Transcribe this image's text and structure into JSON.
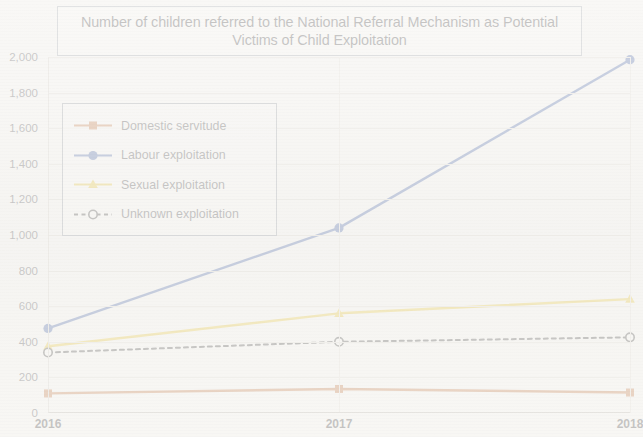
{
  "title": "Number of children referred to the National Referral Mechanism as Potential Victims of Child Exploitation",
  "legend": {
    "items": [
      {
        "label": "Domestic servitude",
        "color": "#c0703a",
        "marker": "square",
        "style": "solid"
      },
      {
        "label": "Labour exploitation",
        "color": "#3b5ba5",
        "marker": "circle",
        "style": "solid"
      },
      {
        "label": "Sexual exploitation",
        "color": "#e8c52e",
        "marker": "triangle",
        "style": "solid"
      },
      {
        "label": "Unknown exploitation",
        "color": "#3b3b3b",
        "marker": "open-circle",
        "style": "dashed"
      }
    ]
  },
  "chart_data": {
    "type": "line",
    "title": "Number of children referred to the National Referral Mechanism as Potential Victims of Child Exploitation",
    "xlabel": "",
    "ylabel": "",
    "categories": [
      "2016",
      "2017",
      "2018"
    ],
    "x_tick_labels": [
      "2016",
      "2017",
      "2018"
    ],
    "y_tick_labels": [
      "0",
      "200",
      "400",
      "600",
      "800",
      "1,000",
      "1,200",
      "1,400",
      "1,600",
      "1,800",
      "2,000"
    ],
    "y_ticks": [
      0,
      200,
      400,
      600,
      800,
      1000,
      1200,
      1400,
      1600,
      1800,
      2000
    ],
    "ylim": [
      0,
      2000
    ],
    "grid": true,
    "grid_axis": "y",
    "legend_position": "upper-left-inside",
    "series": [
      {
        "name": "Domestic servitude",
        "color": "#c0703a",
        "marker": "square",
        "line_style": "solid",
        "values": [
          110,
          135,
          115
        ]
      },
      {
        "name": "Labour exploitation",
        "color": "#3b5ba5",
        "marker": "circle",
        "line_style": "solid",
        "values": [
          475,
          1040,
          1985
        ]
      },
      {
        "name": "Sexual exploitation",
        "color": "#e8c52e",
        "marker": "triangle",
        "line_style": "solid",
        "values": [
          375,
          560,
          640
        ]
      },
      {
        "name": "Unknown exploitation",
        "color": "#3b3b3b",
        "marker": "open-circle",
        "line_style": "dashed",
        "values": [
          340,
          400,
          425
        ]
      }
    ]
  }
}
